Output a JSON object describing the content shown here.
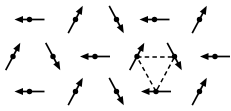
{
  "figure": {
    "name": "spin-lattice-diagram",
    "width": 231,
    "height": 111,
    "background_color": "#ffffff",
    "ink_color": "#000000",
    "rows_count": 3,
    "columns_note": "rows 1 and 3 contain 5 spins; row 2 contains 6 spins offset by half a lattice spacing"
  },
  "legend": {
    "arrow_label": "spin vector",
    "dot_label": "lattice site",
    "dashed_label": "elementary triangle"
  },
  "triangle": {
    "name": "dashed-triangle",
    "style": "dashed",
    "stroke_width": 1.5,
    "dash_pattern": "4.5 3.2",
    "vertices": [
      {
        "label": "upper-left-vertex",
        "x": 137,
        "y": 57
      },
      {
        "label": "upper-right-vertex",
        "x": 174.5,
        "y": 57
      },
      {
        "label": "bottom-vertex",
        "x": 156,
        "y": 91.5
      }
    ]
  },
  "spins": [
    {
      "id": "r1c1",
      "row": 1,
      "col": 1,
      "direction": "left",
      "angle_deg": 180,
      "x": 29.5,
      "y": 19.5,
      "length": 30
    },
    {
      "id": "r1c2",
      "row": 1,
      "col": 2,
      "direction": "up-right",
      "angle_deg": 62,
      "x": 75.5,
      "y": 19.5,
      "length": 31
    },
    {
      "id": "r1c3",
      "row": 1,
      "col": 3,
      "direction": "down-right",
      "angle_deg": -62,
      "x": 116.5,
      "y": 19.5,
      "length": 31
    },
    {
      "id": "r1c4",
      "row": 1,
      "col": 4,
      "direction": "left",
      "angle_deg": 180,
      "x": 154.5,
      "y": 19.5,
      "length": 30
    },
    {
      "id": "r1c5",
      "row": 1,
      "col": 5,
      "direction": "up-right",
      "angle_deg": 62,
      "x": 199.5,
      "y": 19.5,
      "length": 31
    },
    {
      "id": "r2c1",
      "row": 2,
      "col": 1,
      "direction": "up-right",
      "angle_deg": 62,
      "x": 13.0,
      "y": 56.5,
      "length": 31
    },
    {
      "id": "r2c2",
      "row": 2,
      "col": 2,
      "direction": "down-right",
      "angle_deg": -62,
      "x": 53.0,
      "y": 56.5,
      "length": 31
    },
    {
      "id": "r2c3",
      "row": 2,
      "col": 3,
      "direction": "left",
      "angle_deg": 180,
      "x": 95.0,
      "y": 56.5,
      "length": 30
    },
    {
      "id": "r2c4",
      "row": 2,
      "col": 4,
      "direction": "up-right",
      "angle_deg": 62,
      "x": 137.0,
      "y": 56.5,
      "length": 31
    },
    {
      "id": "r2c5",
      "row": 2,
      "col": 5,
      "direction": "down-right",
      "angle_deg": -62,
      "x": 174.5,
      "y": 56.5,
      "length": 31
    },
    {
      "id": "r2c6",
      "row": 2,
      "col": 6,
      "direction": "left",
      "angle_deg": 180,
      "x": 215.0,
      "y": 56.5,
      "length": 30
    },
    {
      "id": "r3c1",
      "row": 3,
      "col": 1,
      "direction": "left",
      "angle_deg": 180,
      "x": 29.5,
      "y": 91.5,
      "length": 30
    },
    {
      "id": "r3c2",
      "row": 3,
      "col": 2,
      "direction": "up-right",
      "angle_deg": 62,
      "x": 75.5,
      "y": 91.5,
      "length": 31
    },
    {
      "id": "r3c3",
      "row": 3,
      "col": 3,
      "direction": "down-right",
      "angle_deg": -62,
      "x": 116.5,
      "y": 91.5,
      "length": 31
    },
    {
      "id": "r3c4",
      "row": 3,
      "col": 4,
      "direction": "left",
      "angle_deg": 180,
      "x": 156.0,
      "y": 91.5,
      "length": 30
    },
    {
      "id": "r3c5",
      "row": 3,
      "col": 5,
      "direction": "up-right",
      "angle_deg": 62,
      "x": 199.5,
      "y": 91.5,
      "length": 31
    }
  ]
}
